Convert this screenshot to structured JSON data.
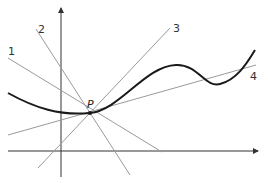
{
  "diagram": {
    "point_label": "P",
    "line_labels": [
      "1",
      "2",
      "3",
      "4"
    ],
    "colors": {
      "curve": "#1a1a1a",
      "axes": "#333333",
      "lines": "#9a9a9a",
      "text": "#333333"
    }
  }
}
